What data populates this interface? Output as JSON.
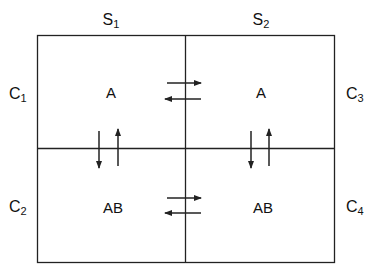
{
  "columns": [
    {
      "id": "S1",
      "base": "S",
      "sub": "1"
    },
    {
      "id": "S2",
      "base": "S",
      "sub": "2"
    }
  ],
  "rows_left": [
    {
      "id": "C1",
      "base": "C",
      "sub": "1"
    },
    {
      "id": "C2",
      "base": "C",
      "sub": "2"
    }
  ],
  "rows_right": [
    {
      "id": "C3",
      "base": "C",
      "sub": "3"
    },
    {
      "id": "C4",
      "base": "C",
      "sub": "4"
    }
  ],
  "cells": [
    {
      "position": "top-left",
      "label": "A"
    },
    {
      "position": "top-right",
      "label": "A"
    },
    {
      "position": "bottom-left",
      "label": "AB"
    },
    {
      "position": "bottom-right",
      "label": "AB"
    }
  ],
  "equilibria": [
    {
      "between": "top-left ⇄ top-right",
      "orientation": "horizontal"
    },
    {
      "between": "bottom-left ⇄ bottom-right",
      "orientation": "horizontal"
    },
    {
      "between": "top-left ⇄ bottom-left",
      "orientation": "vertical"
    },
    {
      "between": "top-right ⇄ bottom-right",
      "orientation": "vertical"
    }
  ],
  "colors": {
    "line": "#222222",
    "background": "#ffffff"
  }
}
